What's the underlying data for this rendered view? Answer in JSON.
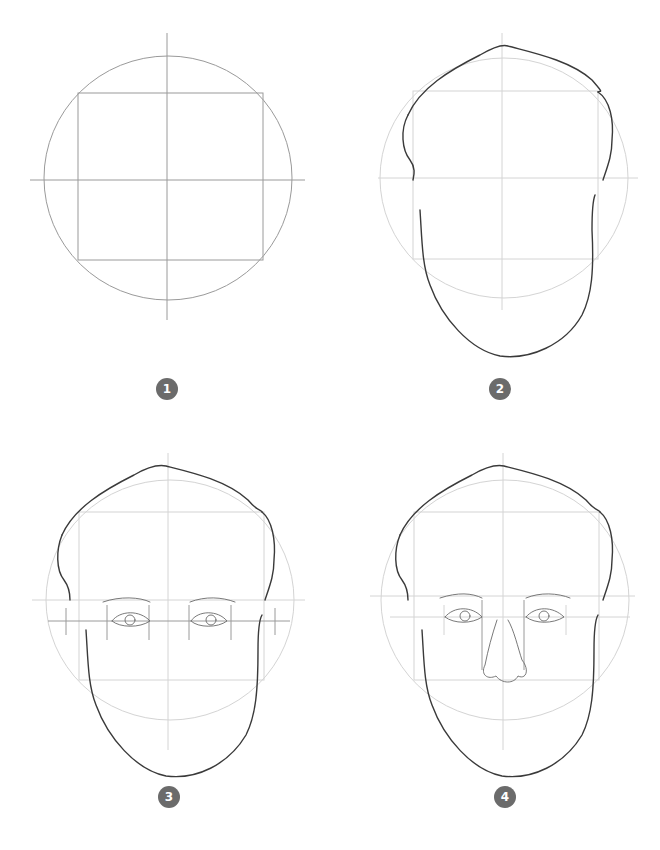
{
  "steps": [
    {
      "number": "1",
      "description": "Circle with square and center guides"
    },
    {
      "number": "2",
      "description": "Head outline with hair and jaw"
    },
    {
      "number": "3",
      "description": "Eyes and eye-line guides added"
    },
    {
      "number": "4",
      "description": "Nose added"
    }
  ],
  "colors": {
    "badge": "#6b6b6b",
    "badge_text": "#ffffff",
    "line": "#3a3a3a",
    "guide": "#9a9a9a"
  }
}
